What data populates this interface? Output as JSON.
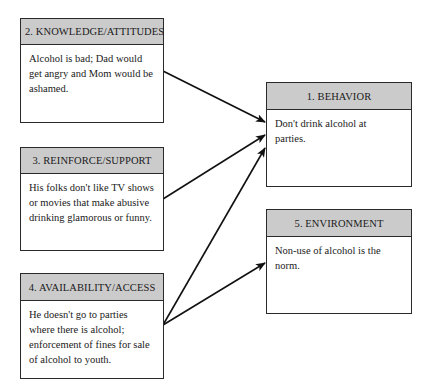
{
  "boxes": {
    "behavior": {
      "title": "1. BEHAVIOR",
      "text": "Don't drink alcohol at parties."
    },
    "knowledge": {
      "title": "2. KNOWLEDGE/ATTITUDES",
      "text": "Alcohol is bad; Dad would get angry and Mom would be ashamed."
    },
    "reinforce": {
      "title": "3. REINFORCE/SUPPORT",
      "text": "His folks don't like TV shows or movies that make abusive drinking glamorous or funny."
    },
    "availability": {
      "title": "4. AVAILABILITY/ACCESS",
      "text": "He doesn't go to parties where there is alcohol; enforcement of fines for sale of alcohol to youth."
    },
    "environment": {
      "title": "5. ENVIRONMENT",
      "text": "Non-use of alcohol is the norm."
    }
  },
  "arrows": [
    {
      "from": "knowledge",
      "to": "behavior"
    },
    {
      "from": "reinforce",
      "to": "behavior"
    },
    {
      "from": "availability",
      "to": "behavior"
    },
    {
      "from": "availability",
      "to": "environment"
    }
  ],
  "colors": {
    "header_fill": "#cbcbcb",
    "border": "#2a2a2a",
    "arrow": "#111111"
  }
}
